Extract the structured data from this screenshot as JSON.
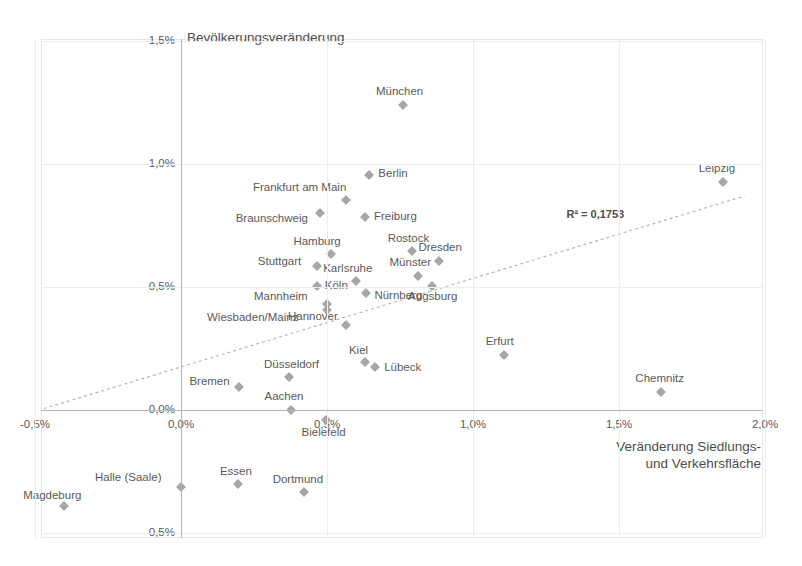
{
  "chart_data": {
    "type": "scatter",
    "title": "Bevölkerungsveränderung",
    "xlabel": "Veränderung Siedlungs-\nund Verkehrsfläche",
    "ylabel": "Bevölkerungsveränderung",
    "xlim": [
      -0.5,
      2.0
    ],
    "ylim": [
      -0.5,
      1.5
    ],
    "xticks": [
      "-0,5%",
      "0,0%",
      "0,5%",
      "1,0%",
      "1,5%",
      "2,0%"
    ],
    "yticks": [
      "1,5%",
      "1,0%",
      "0,5%",
      "0,0%",
      "-0,5%"
    ],
    "grid": true,
    "legend": "none",
    "annotation": "R² = 0,1753",
    "r_squared": 0.1753,
    "trendline": {
      "type": "linear",
      "style": "dotted"
    },
    "point_color": "#a6a6a6",
    "grid_color": "#ededed",
    "axis_color": "#b4b4b4",
    "points": [
      {
        "label": "München",
        "x": 0.76,
        "y": 1.24,
        "lx": -27,
        "ly": -20
      },
      {
        "label": "Leipzig",
        "x": 1.855,
        "y": 0.925,
        "lx": -24,
        "ly": -20
      },
      {
        "label": "Berlin",
        "x": 0.645,
        "y": 0.955,
        "lx": 9,
        "ly": -8
      },
      {
        "label": "Frankfurt am Main",
        "x": 0.565,
        "y": 0.855,
        "lx": -93,
        "ly": -19
      },
      {
        "label": "Braunschweig",
        "x": 0.475,
        "y": 0.8,
        "lx": -84,
        "ly": -1
      },
      {
        "label": "Freiburg",
        "x": 0.63,
        "y": 0.785,
        "lx": 9,
        "ly": -7
      },
      {
        "label": "Rostock",
        "x": 0.79,
        "y": 0.645,
        "lx": -24,
        "ly": -19
      },
      {
        "label": "Dresden",
        "x": 0.885,
        "y": 0.605,
        "lx": -21,
        "ly": -20
      },
      {
        "label": "Hamburg",
        "x": 0.515,
        "y": 0.635,
        "lx": -38,
        "ly": -19
      },
      {
        "label": "Münster",
        "x": 0.81,
        "y": 0.545,
        "lx": -28,
        "ly": -20
      },
      {
        "label": "Stuttgart",
        "x": 0.465,
        "y": 0.585,
        "lx": -59,
        "ly": -11
      },
      {
        "label": "Karlsruhe",
        "x": 0.6,
        "y": 0.525,
        "lx": -33,
        "ly": -19
      },
      {
        "label": "Köln",
        "x": 0.465,
        "y": 0.505,
        "lx": 8,
        "ly": -7
      },
      {
        "label": "Nürnberg",
        "x": 0.635,
        "y": 0.475,
        "lx": 8,
        "ly": -4
      },
      {
        "label": "Augsburg",
        "x": 0.86,
        "y": 0.505,
        "lx": -24,
        "ly": 4
      },
      {
        "label": "Mannheim",
        "x": 0.5,
        "y": 0.43,
        "lx": -73,
        "ly": -14
      },
      {
        "label": "Wiesbaden/Mainz",
        "x": 0.5,
        "y": 0.405,
        "lx": -120,
        "ly": 1
      },
      {
        "label": "Hannover",
        "x": 0.565,
        "y": 0.345,
        "lx": -58,
        "ly": -15
      },
      {
        "label": "Erfurt",
        "x": 1.105,
        "y": 0.225,
        "lx": -18,
        "ly": -20
      },
      {
        "label": "Kiel",
        "x": 0.63,
        "y": 0.195,
        "lx": -16,
        "ly": -18
      },
      {
        "label": "Lübeck",
        "x": 0.665,
        "y": 0.175,
        "lx": 9,
        "ly": -6
      },
      {
        "label": "Düsseldorf",
        "x": 0.37,
        "y": 0.135,
        "lx": -25,
        "ly": -19
      },
      {
        "label": "Bremen",
        "x": 0.2,
        "y": 0.095,
        "lx": -50,
        "ly": -12
      },
      {
        "label": "Chemnitz",
        "x": 1.645,
        "y": 0.075,
        "lx": -26,
        "ly": -20
      },
      {
        "label": "Aachen",
        "x": 0.375,
        "y": 0.0,
        "lx": -26,
        "ly": -20
      },
      {
        "label": "Bielefeld",
        "x": 0.495,
        "y": -0.04,
        "lx": -24,
        "ly": 6
      },
      {
        "label": "Essen",
        "x": 0.195,
        "y": -0.3,
        "lx": -18,
        "ly": -19
      },
      {
        "label": "Halle (Saale)",
        "x": 0.0,
        "y": -0.315,
        "lx": -86,
        "ly": -16
      },
      {
        "label": "Dortmund",
        "x": 0.42,
        "y": -0.335,
        "lx": -31,
        "ly": -19
      },
      {
        "label": "Magdeburg",
        "x": -0.4,
        "y": -0.39,
        "lx": -41,
        "ly": -17
      }
    ]
  }
}
